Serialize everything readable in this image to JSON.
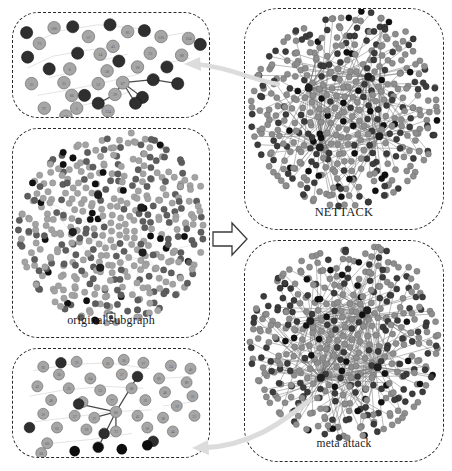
{
  "figure": {
    "background_color": "#ffffff",
    "panel_border_color": "#2b2b2b",
    "arrow_color": "#cfcfcf",
    "node_light_color": "#9a9a9a",
    "node_dark_color": "#3a3a3a",
    "node_black_color": "#111111",
    "edge_color": "#8c8c8c",
    "highlight_edge_color": "#555555"
  },
  "panels": {
    "zoom_top": {
      "name": "zoomed-detail-nettack",
      "caption": "",
      "description": "magnified node cluster with numbered circular nodes and highlighted attack edges",
      "node_count": 38,
      "highlight_edges": 5
    },
    "original": {
      "name": "original-subgraph",
      "caption": "original subgraph",
      "description": "dense circular cloud of nodes with faint edges",
      "node_count": 420
    },
    "zoom_bottom": {
      "name": "zoomed-detail-meta",
      "caption": "",
      "description": "magnified node cluster with numbered circular nodes and highlighted attack edges radiating from a center node",
      "node_count": 46,
      "highlight_edges": 5
    },
    "nettack": {
      "name": "nettack-graph",
      "caption": "NETTACK",
      "description": "dense hairball network with several high degree hub nodes",
      "node_count": 430
    },
    "meta": {
      "name": "meta-attack-graph",
      "caption": "meta attack",
      "description": "dense hairball network with several high degree hub nodes",
      "node_count": 430
    }
  },
  "connectors": {
    "main_arrow": {
      "name": "transform-arrow",
      "direction": "right",
      "style": "hollow block arrow"
    },
    "top_curve": {
      "name": "zoom-link-top",
      "direction": "left",
      "style": "curved tapered arrow"
    },
    "bottom_curve": {
      "name": "zoom-link-bottom",
      "direction": "left",
      "style": "curved tapered arrow"
    }
  },
  "node_labels": {
    "zoom_top": [
      "73",
      "106",
      "120",
      "104",
      "57",
      "81",
      "65",
      "43",
      "14",
      "53",
      "88",
      "6",
      "14",
      "58",
      "18",
      "80",
      "69",
      "35",
      "52",
      "67",
      "73",
      "29",
      "66",
      "59",
      "61",
      "38",
      "5",
      "104",
      "97",
      "134",
      "54"
    ],
    "zoom_bottom": [
      "92",
      "33",
      "61",
      "36",
      "97",
      "24",
      "40",
      "30",
      "64",
      "17",
      "85",
      "89",
      "41",
      "25",
      "53",
      "68",
      "46",
      "33",
      "48",
      "40",
      "77",
      "29",
      "19",
      "31",
      "27",
      "37",
      "66"
    ]
  }
}
